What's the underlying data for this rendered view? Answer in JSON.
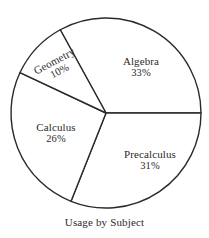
{
  "chart_data": {
    "type": "pie",
    "title": "Usage by Subject",
    "caption": "Usage by Subject",
    "categories": [
      "Algebra",
      "Precalculus",
      "Calculus",
      "Geometry"
    ],
    "values": [
      33,
      31,
      26,
      10
    ],
    "unit": "%",
    "legend": "none",
    "grid": false,
    "slices": [
      {
        "name": "Algebra",
        "label": "Algebra",
        "value": 33,
        "value_label": "33%",
        "start_angle_deg": -118.8,
        "end_angle_deg": 0.0,
        "color": "#ffffff",
        "outline": "#2a2a2a",
        "rotation_deg": 0
      },
      {
        "name": "Precalculus",
        "label": "Precalculus",
        "value": 31,
        "value_label": "31%",
        "start_angle_deg": 0.0,
        "end_angle_deg": 111.6,
        "color": "#ffffff",
        "outline": "#2a2a2a",
        "rotation_deg": 0
      },
      {
        "name": "Calculus",
        "label": "Calculus",
        "value": 26,
        "value_label": "26%",
        "start_angle_deg": 111.6,
        "end_angle_deg": 205.2,
        "color": "#ffffff",
        "outline": "#2a2a2a",
        "rotation_deg": 0
      },
      {
        "name": "Geometry",
        "label": "Geometry",
        "value": 10,
        "value_label": "10%",
        "start_angle_deg": 205.2,
        "end_angle_deg": 241.2,
        "color": "#ffffff",
        "outline": "#2a2a2a",
        "rotation_deg": -28
      }
    ],
    "geometry": {
      "center_x": 106,
      "center_y": 113,
      "radius": 95
    }
  }
}
